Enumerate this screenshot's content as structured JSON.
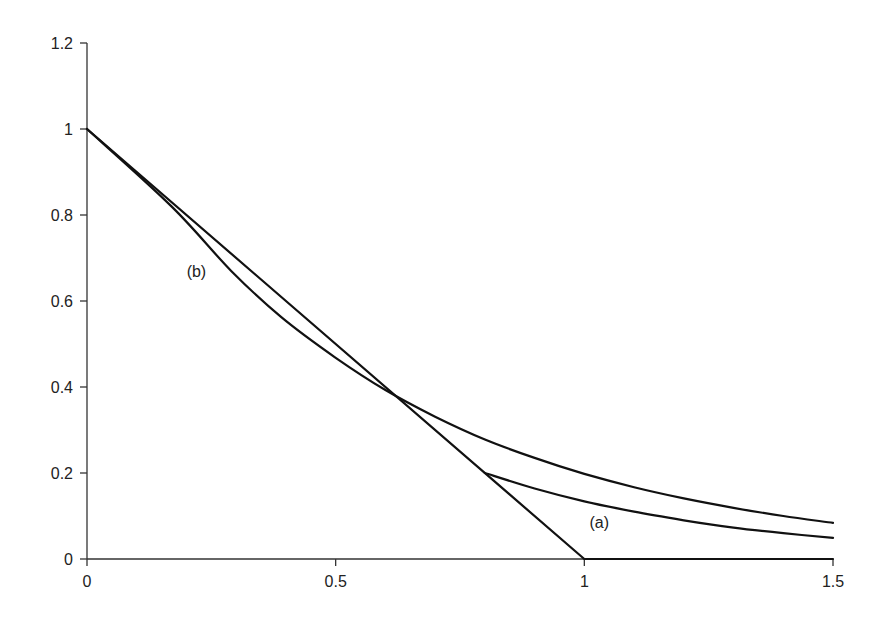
{
  "chart_data": {
    "type": "line",
    "title": "",
    "xlabel": "",
    "ylabel": "",
    "xlim": [
      0,
      1.5
    ],
    "ylim": [
      0,
      1.2
    ],
    "grid": false,
    "legend": null,
    "x_ticks": [
      {
        "value": 0,
        "label": "0"
      },
      {
        "value": 0.5,
        "label": "0.5"
      },
      {
        "value": 1,
        "label": "1"
      },
      {
        "value": 1.5,
        "label": "1.5"
      }
    ],
    "y_ticks": [
      {
        "value": 0,
        "label": "0"
      },
      {
        "value": 0.2,
        "label": "0.2"
      },
      {
        "value": 0.4,
        "label": "0.4"
      },
      {
        "value": 0.6,
        "label": "0.6"
      },
      {
        "value": 0.8,
        "label": "0.8"
      },
      {
        "value": 1,
        "label": "1"
      },
      {
        "value": 1.2,
        "label": "1.2"
      }
    ],
    "series": [
      {
        "name": "piecewise-linear",
        "x": [
          0,
          1,
          1.5
        ],
        "y": [
          1,
          0,
          0
        ]
      },
      {
        "name": "curve-b",
        "x": [
          0,
          0.17,
          0.29,
          0.39,
          0.5,
          0.6,
          0.7,
          0.8,
          0.9,
          1.0,
          1.1,
          1.2,
          1.3,
          1.4,
          1.5
        ],
        "y": [
          1,
          0.82,
          0.67,
          0.563,
          0.468,
          0.393,
          0.331,
          0.278,
          0.235,
          0.198,
          0.167,
          0.141,
          0.119,
          0.1,
          0.084
        ]
      },
      {
        "name": "curve-a",
        "x": [
          0.8,
          0.9,
          1.0,
          1.1,
          1.2,
          1.3,
          1.4,
          1.5
        ],
        "y": [
          0.2,
          0.164,
          0.134,
          0.11,
          0.09,
          0.073,
          0.06,
          0.049
        ]
      }
    ],
    "annotations": [
      {
        "text": "(a)",
        "x": 1.03,
        "y": 0.085
      },
      {
        "text": "(b)",
        "x": 0.22,
        "y": 0.67
      }
    ]
  }
}
